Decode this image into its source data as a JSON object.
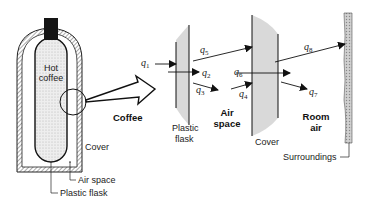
{
  "figure": {
    "thermos": {
      "contents_label": [
        "Hot",
        "coffee"
      ],
      "cover_label": "Cover",
      "air_space_label": "Air space",
      "flask_label": "Plastic flask"
    },
    "expanded_view": {
      "arrow_label": "Coffee",
      "plastic_flask_label": [
        "Plastic",
        "flask"
      ],
      "air_space_label": [
        "Air",
        "space"
      ],
      "cover_label": "Cover",
      "room_air_label": [
        "Room",
        "air"
      ],
      "surroundings_label": "Surroundings"
    },
    "heat_flows": [
      {
        "symbol": "q",
        "sub": "1"
      },
      {
        "symbol": "q",
        "sub": "2"
      },
      {
        "symbol": "q",
        "sub": "3"
      },
      {
        "symbol": "q",
        "sub": "4"
      },
      {
        "symbol": "q",
        "sub": "5"
      },
      {
        "symbol": "q",
        "sub": "6"
      },
      {
        "symbol": "q",
        "sub": "7"
      },
      {
        "symbol": "q",
        "sub": "8"
      }
    ],
    "colors": {
      "line": "#1a1a1a",
      "slab_fill": "#d9d9d9",
      "coffee_fill": "#e6e6e6",
      "cap": "#151515"
    }
  }
}
